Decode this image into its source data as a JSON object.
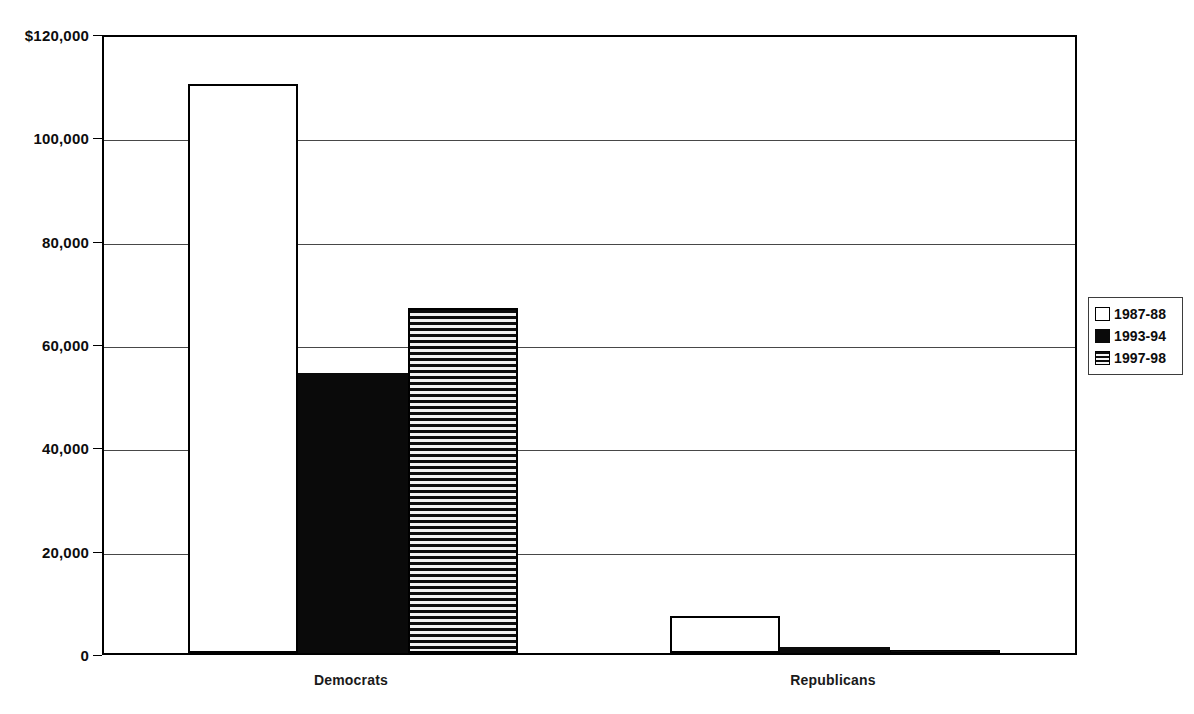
{
  "chart_data": {
    "type": "bar",
    "title": "",
    "subtitle": "",
    "xlabel": "",
    "ylabel": "",
    "categories": [
      "Democrats",
      "Republicans"
    ],
    "series": [
      {
        "name": "1987-88",
        "fill": "empty",
        "values": [
          110100,
          7200
        ]
      },
      {
        "name": "1993-94",
        "fill": "solid",
        "values": [
          54200,
          1100
        ]
      },
      {
        "name": "1997-98",
        "fill": "hstripe",
        "values": [
          66800,
          600
        ]
      }
    ],
    "ylim": [
      0,
      120000
    ],
    "ytick_values": [
      120000,
      100000,
      80000,
      60000,
      40000,
      20000,
      0
    ],
    "ytick_labels": [
      "$120,000",
      "100,000",
      "80,000",
      "60,000",
      "40,000",
      "20,000",
      "0"
    ],
    "grid": true,
    "legend_position": "right",
    "colors": {
      "axis": "#000000",
      "gridline": "#000000",
      "bar_outline": "#000000",
      "bar_solid": "#0a0a0a",
      "background": "#ffffff"
    }
  }
}
